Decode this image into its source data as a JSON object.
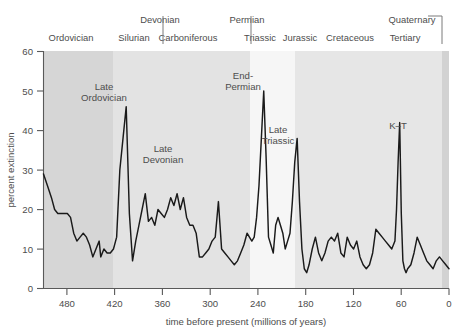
{
  "chart_data": {
    "type": "line",
    "title": "",
    "subtitle": "",
    "xlabel": "time before present (millions of years)",
    "ylabel": "percent extinction",
    "xlim": [
      510,
      0
    ],
    "ylim": [
      0,
      60
    ],
    "x_ticks": [
      480,
      420,
      360,
      300,
      240,
      180,
      120,
      60,
      0
    ],
    "y_ticks": [
      0,
      10,
      20,
      30,
      40,
      50,
      60
    ],
    "grid": false,
    "legend": "none",
    "x_axis_inverted": true,
    "line_color": "#1a1a1a",
    "series": [
      {
        "name": "percent extinction",
        "x": [
          510,
          505,
          500,
          496,
          492,
          488,
          484,
          480,
          476,
          472,
          468,
          464,
          460,
          456,
          452,
          448,
          444,
          440,
          438,
          436,
          434,
          430,
          426,
          422,
          418,
          414,
          410,
          406,
          402,
          398,
          394,
          390,
          386,
          382,
          378,
          374,
          370,
          366,
          362,
          358,
          354,
          350,
          346,
          342,
          338,
          334,
          330,
          326,
          322,
          318,
          314,
          310,
          306,
          302,
          298,
          294,
          290,
          286,
          282,
          278,
          274,
          270,
          266,
          262,
          258,
          254,
          251,
          248,
          245,
          242,
          239,
          236,
          233,
          230,
          227,
          224,
          221,
          218,
          215,
          212,
          209,
          206,
          203,
          200,
          197,
          194,
          191,
          188,
          185,
          182,
          179,
          176,
          172,
          168,
          164,
          160,
          156,
          152,
          148,
          144,
          140,
          136,
          132,
          128,
          124,
          120,
          116,
          112,
          108,
          104,
          100,
          96,
          92,
          88,
          84,
          80,
          76,
          72,
          68,
          66,
          64,
          62,
          60,
          58,
          56,
          54,
          52,
          48,
          44,
          40,
          36,
          32,
          28,
          24,
          20,
          16,
          12,
          8,
          4,
          0
        ],
        "values": [
          29,
          26,
          23,
          20,
          19,
          19,
          19,
          19,
          18,
          14,
          12,
          13,
          14,
          13,
          11,
          8,
          10,
          12,
          8,
          9,
          10,
          9,
          9,
          10,
          13,
          30,
          38,
          46,
          19,
          7,
          12,
          16,
          20,
          24,
          17,
          18,
          16,
          20,
          19,
          18,
          20,
          23,
          21,
          24,
          20,
          23,
          18,
          16,
          16,
          14,
          8,
          8,
          9,
          10,
          12,
          13,
          22,
          10,
          9,
          8,
          7,
          6,
          7,
          9,
          11,
          14,
          13,
          12,
          13,
          18,
          26,
          38,
          50,
          33,
          13,
          11,
          9,
          16,
          18,
          16,
          14,
          10,
          12,
          14,
          22,
          32,
          38,
          22,
          10,
          5,
          4,
          6,
          10,
          13,
          9,
          7,
          9,
          12,
          13,
          12,
          14,
          9,
          8,
          13,
          11,
          10,
          12,
          8,
          6,
          5,
          6,
          9,
          15,
          14,
          13,
          12,
          11,
          10,
          12,
          20,
          32,
          42,
          19,
          7,
          5,
          4,
          5,
          6,
          9,
          13,
          11,
          9,
          7,
          6,
          5,
          7,
          8,
          7,
          6,
          5
        ]
      }
    ],
    "annotations": [
      {
        "label_line1": "Late",
        "label_line2": "Ordovician",
        "x_value": 406,
        "peak_value": 46
      },
      {
        "label_line1": "Late",
        "label_line2": "Devonian",
        "x_value": 368,
        "peak_value": 24
      },
      {
        "label_line1": "End-",
        "label_line2": "Permian",
        "x_value": 233,
        "peak_value": 50
      },
      {
        "label_line1": "Late",
        "label_line2": "Triassic",
        "x_value": 191,
        "peak_value": 38
      },
      {
        "label_line1": "K–T",
        "label_line2": "",
        "x_value": 62,
        "peak_value": 42
      }
    ],
    "geologic_periods_row_top": [
      {
        "label": "Devonian",
        "x_center": 130
      },
      {
        "label": "Permian",
        "x_center": 215
      },
      {
        "label": "Quaternary",
        "x_center": 380
      }
    ],
    "geologic_periods_row_bottom": [
      {
        "label": "Ordovician",
        "x_center": 25
      },
      {
        "label": "Silurian",
        "x_center": 82
      },
      {
        "label": "Carboniferous",
        "x_center": 130
      },
      {
        "label": "Triassic",
        "x_center": 215
      },
      {
        "label": "Jurassic",
        "x_center": 252
      },
      {
        "label": "Cretaceous",
        "x_center": 300
      },
      {
        "label": "Tertiary",
        "x_center": 355
      }
    ],
    "background_bands": [
      {
        "shade": "#d6d6d6",
        "from": 510,
        "to": 437
      },
      {
        "shade": "#e3e3e3",
        "from": 437,
        "to": 256
      },
      {
        "shade": "#f4f4f4",
        "from": 256,
        "to": 198
      },
      {
        "shade": "#e6e6e6",
        "from": 198,
        "to": 0
      }
    ]
  },
  "chart": {
    "ylabel": "percent extinction",
    "xlabel": "time before present (millions of years)",
    "y_ticks": [
      "60",
      "50",
      "40",
      "30",
      "20",
      "10",
      "0"
    ],
    "x_ticks": [
      "480",
      "420",
      "360",
      "300",
      "240",
      "180",
      "120",
      "60",
      "0"
    ],
    "period_top": [
      "Devonian",
      "Permian",
      "Quaternary"
    ],
    "period_bottom": [
      "Ordovician",
      "Silurian",
      "Carboniferous",
      "Triassic",
      "Jurassic",
      "Cretaceous",
      "Tertiary"
    ],
    "annotations": [
      "Late",
      "Ordovician",
      "Late",
      "Devonian",
      "End-",
      "Permian",
      "Late",
      "Triassic",
      "K–T"
    ],
    "colors": {
      "line": "#1a1a1a",
      "axis": "#555555",
      "text": "#4d4d4d",
      "band_dark": "#d6d6d6",
      "band_mid": "#e3e3e3",
      "band_light": "#f4f4f4",
      "band_right": "#e6e6e6"
    }
  }
}
